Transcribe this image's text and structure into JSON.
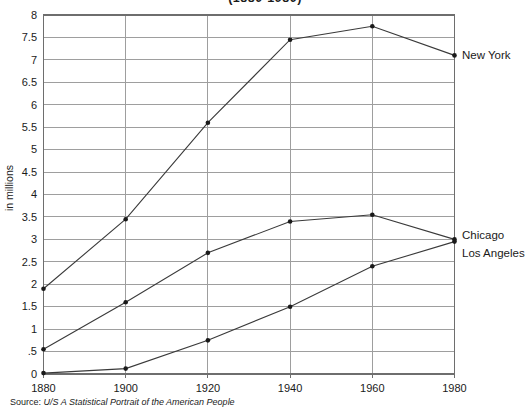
{
  "title": "(1880-1980)",
  "y_axis_label": "in millions",
  "source": {
    "prefix": "Source:",
    "text": "U/S A Statistical Portrait of the American People"
  },
  "chart_data": {
    "type": "line",
    "title": "(1880-1980)",
    "xlabel": "",
    "ylabel": "in millions",
    "x": [
      1880,
      1900,
      1920,
      1940,
      1960,
      1980
    ],
    "series": [
      {
        "name": "New York",
        "values": [
          1.9,
          3.45,
          5.6,
          7.45,
          7.75,
          7.1
        ]
      },
      {
        "name": "Chicago",
        "values": [
          0.55,
          1.6,
          2.7,
          3.4,
          3.55,
          3.0
        ]
      },
      {
        "name": "Los Angeles",
        "values": [
          0.02,
          0.12,
          0.75,
          1.5,
          2.4,
          2.95
        ]
      }
    ],
    "ylim": [
      0,
      8
    ],
    "ytick_step": 0.5,
    "ytick_labels": [
      "0",
      ".5",
      "1",
      "1.5",
      "2",
      "2.5",
      "3",
      "3.5",
      "4",
      "4.5",
      "5",
      "5.5",
      "6",
      "6.5",
      "7",
      "7.5",
      "8"
    ],
    "grid": true,
    "legend_position": "right-of-line-end",
    "colors": {
      "line": "#3a3a3a",
      "marker": "#1a1a1a",
      "grid": "#9e9e9e",
      "border": "#6e6e6e",
      "text": "#1a1a1a"
    }
  }
}
